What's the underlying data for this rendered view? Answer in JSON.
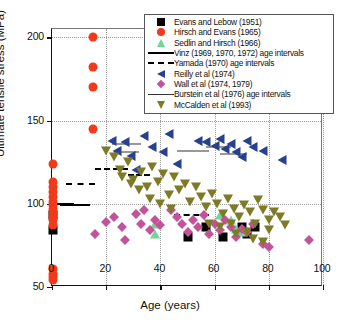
{
  "chart_data": {
    "type": "scatter",
    "title": "",
    "xlabel": "Age (years)",
    "ylabel": "Ultimate tensile stress (MPa)",
    "xlim": [
      0,
      100
    ],
    "ylim": [
      50,
      205
    ],
    "xticks": [
      0,
      20,
      40,
      60,
      80,
      100
    ],
    "yticks": [
      50,
      100,
      150,
      200
    ],
    "grid": "dotted major gridlines",
    "legend_position": "top-right inside axes",
    "series": [
      {
        "name": "Evans and Lebow (1951)",
        "marker": "square",
        "color": "#000000",
        "points": [
          [
            0.5,
            93
          ],
          [
            0.5,
            84
          ],
          [
            50,
            80
          ],
          [
            57,
            86
          ],
          [
            63,
            80
          ],
          [
            70,
            86
          ],
          [
            72,
            82
          ],
          [
            75,
            86
          ]
        ]
      },
      {
        "name": "Hirsch and Evans (1965)",
        "marker": "circle",
        "color": "#f2391a",
        "points": [
          [
            15,
            200
          ],
          [
            15,
            182
          ],
          [
            15,
            170
          ],
          [
            15,
            145
          ],
          [
            0.5,
            124
          ],
          [
            0.5,
            113
          ],
          [
            0.5,
            110
          ],
          [
            0.5,
            107
          ],
          [
            0.5,
            104
          ],
          [
            0.5,
            101
          ],
          [
            0.5,
            99
          ],
          [
            0.5,
            97
          ],
          [
            0.5,
            95
          ],
          [
            0.5,
            92
          ],
          [
            0.5,
            90
          ],
          [
            0.5,
            87
          ],
          [
            0.5,
            61
          ],
          [
            0.5,
            58
          ],
          [
            0.5,
            56
          ],
          [
            0.5,
            54
          ]
        ]
      },
      {
        "name": "Sedlin and Hirsch (1966)",
        "marker": "triangle-up",
        "color": "#73d49a",
        "points": [
          [
            38,
            88
          ],
          [
            38,
            82
          ],
          [
            62,
            93
          ],
          [
            66,
            90
          ],
          [
            68,
            85
          ],
          [
            70,
            83
          ]
        ]
      },
      {
        "name": "Vinz (1969, 1970, 1972) age intervals",
        "marker": "solid-line",
        "color": "#000000",
        "segments": [
          [
            0,
            8,
            100
          ],
          [
            3,
            14,
            99
          ]
        ]
      },
      {
        "name": "Yamada (1970) age intervals",
        "marker": "dashed-line",
        "color": "#000000",
        "segments": [
          [
            5,
            16,
            112
          ],
          [
            16,
            28,
            121
          ],
          [
            28,
            36,
            117
          ],
          [
            45,
            58,
            93
          ]
        ]
      },
      {
        "name": "Reilly et al (1974)",
        "marker": "triangle-left",
        "color": "#27408f",
        "points": [
          [
            22,
            138
          ],
          [
            24,
            132
          ],
          [
            27,
            137
          ],
          [
            29,
            129
          ],
          [
            31,
            120
          ],
          [
            34,
            141
          ],
          [
            37,
            134
          ],
          [
            41,
            131
          ],
          [
            43,
            142
          ],
          [
            46,
            124
          ],
          [
            54,
            138
          ],
          [
            57,
            137
          ],
          [
            60,
            135
          ],
          [
            62,
            139
          ],
          [
            64,
            133
          ],
          [
            66,
            136
          ],
          [
            68,
            131
          ],
          [
            70,
            128
          ],
          [
            72,
            138
          ],
          [
            74,
            134
          ],
          [
            78,
            132
          ],
          [
            85,
            126
          ]
        ]
      },
      {
        "name": "Wall et al (1974, 1979)",
        "marker": "diamond",
        "color": "#c3529a",
        "points": [
          [
            16,
            82
          ],
          [
            20,
            89
          ],
          [
            23,
            92
          ],
          [
            26,
            86
          ],
          [
            27,
            78
          ],
          [
            31,
            94
          ],
          [
            33,
            88
          ],
          [
            34,
            96
          ],
          [
            36,
            84
          ],
          [
            38,
            90
          ],
          [
            40,
            87
          ],
          [
            44,
            96
          ],
          [
            46,
            92
          ],
          [
            48,
            88
          ],
          [
            50,
            83
          ],
          [
            52,
            90
          ],
          [
            54,
            86
          ],
          [
            56,
            93
          ],
          [
            58,
            82
          ],
          [
            60,
            88
          ],
          [
            62,
            84
          ],
          [
            64,
            90
          ],
          [
            66,
            86
          ],
          [
            68,
            80
          ],
          [
            70,
            85
          ],
          [
            72,
            83
          ],
          [
            74,
            88
          ],
          [
            78,
            76
          ],
          [
            80,
            74
          ],
          [
            95,
            78
          ]
        ]
      },
      {
        "name": "Burstein et al (1976) age intervals",
        "marker": "thin-line",
        "color": "#333333",
        "segments": [
          [
            22,
            33,
            136
          ],
          [
            23,
            32,
            131
          ],
          [
            46,
            58,
            132
          ],
          [
            62,
            72,
            130
          ],
          [
            57,
            66,
            134
          ]
        ]
      },
      {
        "name": "McCalden et al (1993)",
        "marker": "triangle-down",
        "color": "#7d7b25",
        "points": [
          [
            20,
            132
          ],
          [
            23,
            128
          ],
          [
            25,
            120
          ],
          [
            28,
            125
          ],
          [
            30,
            114
          ],
          [
            33,
            119
          ],
          [
            35,
            110
          ],
          [
            37,
            122
          ],
          [
            39,
            113
          ],
          [
            41,
            118
          ],
          [
            43,
            105
          ],
          [
            45,
            116
          ],
          [
            47,
            108
          ],
          [
            49,
            112
          ],
          [
            51,
            101
          ],
          [
            53,
            110
          ],
          [
            55,
            104
          ],
          [
            57,
            98
          ],
          [
            59,
            106
          ],
          [
            61,
            100
          ],
          [
            63,
            94
          ],
          [
            65,
            103
          ],
          [
            67,
            97
          ],
          [
            69,
            92
          ],
          [
            71,
            99
          ],
          [
            73,
            95
          ],
          [
            75,
            88
          ],
          [
            76,
            102
          ],
          [
            78,
            96
          ],
          [
            80,
            90
          ],
          [
            82,
            95
          ],
          [
            72,
            83
          ],
          [
            74,
            79
          ],
          [
            78,
            77
          ],
          [
            80,
            84
          ],
          [
            66,
            88
          ],
          [
            68,
            82
          ],
          [
            58,
            88
          ],
          [
            62,
            86
          ],
          [
            84,
            92
          ],
          [
            86,
            87
          ],
          [
            44,
            97
          ],
          [
            40,
            100
          ],
          [
            36,
            103
          ],
          [
            32,
            108
          ],
          [
            29,
            112
          ],
          [
            26,
            116
          ]
        ]
      }
    ]
  },
  "legend": {
    "items": [
      {
        "label": "Evans and Lebow (1951)",
        "symbol": "square-marker"
      },
      {
        "label": "Hirsch and Evans (1965)",
        "symbol": "circle-marker"
      },
      {
        "label": "Sedlin and Hirsch (1966)",
        "symbol": "triangle-up-marker"
      },
      {
        "label": "Vinz (1969, 1970, 1972) age intervals",
        "symbol": "solid-line-marker"
      },
      {
        "label": "Yamada (1970) age intervals",
        "symbol": "dashed-line-marker"
      },
      {
        "label": "Reilly et al (1974)",
        "symbol": "triangle-left-marker"
      },
      {
        "label": "Wall et al (1974, 1979)",
        "symbol": "diamond-marker"
      },
      {
        "label": "Burstein et al (1976) age intervals",
        "symbol": "thin-line-marker"
      },
      {
        "label": "McCalden et al (1993)",
        "symbol": "triangle-down-marker"
      }
    ]
  }
}
